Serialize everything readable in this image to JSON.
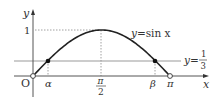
{
  "chart_data": {
    "type": "line",
    "title": "",
    "xlabel": "x",
    "ylabel": "y",
    "origin_label": "O",
    "series": [
      {
        "name": "y=sin x",
        "label_prefix": "y=",
        "label_func": "sin x",
        "x": [
          0,
          0.3398,
          0.7854,
          1.5708,
          2.3562,
          2.8018,
          3.1416
        ],
        "values": [
          0,
          0.3333,
          0.7071,
          1,
          0.7071,
          0.3333,
          0
        ]
      }
    ],
    "horizontal_line": {
      "name": "y=1/3",
      "value": 0.3333,
      "label_prefix": "y=",
      "label_num": "1",
      "label_den": "3"
    },
    "y_ticks": [
      {
        "value": 1,
        "label": "1"
      }
    ],
    "x_ticks": [
      {
        "value": 0.3398,
        "label": "α"
      },
      {
        "value": 1.5708,
        "label_num": "π",
        "label_den": "2"
      },
      {
        "value": 2.8018,
        "label": "β"
      },
      {
        "value": 3.1416,
        "label": "π"
      }
    ],
    "points": [
      {
        "name": "origin",
        "x": 0,
        "y": 0,
        "style": "open"
      },
      {
        "name": "alpha",
        "x": 0.3398,
        "y": 0.3333,
        "style": "filled"
      },
      {
        "name": "beta",
        "x": 2.8018,
        "y": 0.3333,
        "style": "filled"
      },
      {
        "name": "pi",
        "x": 3.1416,
        "y": 0,
        "style": "open"
      }
    ],
    "xlim": [
      -0.35,
      3.6
    ],
    "ylim": [
      -0.4,
      1.5
    ],
    "grid": false,
    "colors": {
      "curve": "#222222",
      "axis": "#333333",
      "hline": "#999999",
      "dotted": "#888888"
    }
  }
}
